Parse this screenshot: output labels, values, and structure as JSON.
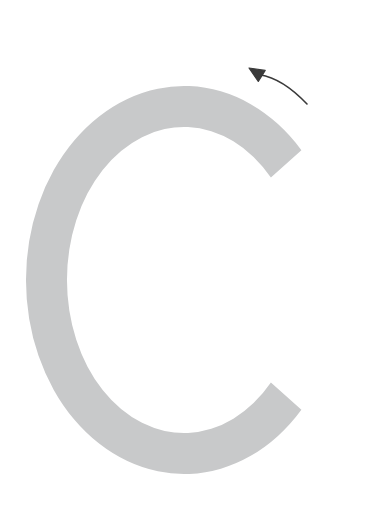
{
  "figure": {
    "background_color": "#ffffff",
    "width": 367,
    "height": 508,
    "glyph": {
      "name": "letter-c-ring",
      "character": "C",
      "color": "#c8c9ca",
      "center_x": 184,
      "center_y": 280,
      "outer_radius_x": 158,
      "outer_radius_y": 194,
      "stroke_thickness": 41,
      "gap_side": "right",
      "gap_start_angle_deg": -42,
      "gap_end_angle_deg": 42,
      "terminal_upper": {
        "x": 343,
        "y": 190
      },
      "terminal_lower": {
        "x": 343,
        "y": 372
      },
      "extent_top_y": 86,
      "extent_bottom_y": 473,
      "extent_left_x": 26,
      "extent_right_x": 345
    },
    "arrow": {
      "name": "rotation-arrow",
      "color": "#3a3a3a",
      "direction": "counterclockwise",
      "points_to": "up-left",
      "tip": {
        "x": 249,
        "y": 68
      },
      "tail": {
        "x": 307,
        "y": 104
      },
      "head_length": 15,
      "head_width": 13,
      "line_width": 1.6
    }
  }
}
